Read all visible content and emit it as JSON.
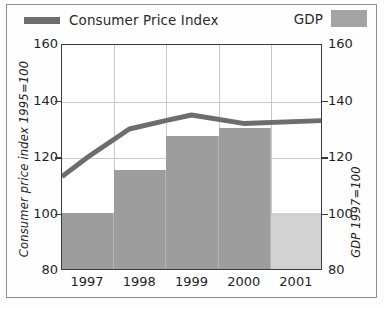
{
  "chart_data": {
    "type": "bar",
    "title": "",
    "subtitle": "",
    "xlabel": "",
    "ylabel": "Consumer price index 1995=100",
    "y2label": "GDP 1997=100",
    "categories": [
      "1997",
      "1998",
      "1999",
      "2000",
      "2001"
    ],
    "ylim": [
      80,
      160
    ],
    "y2lim": [
      80,
      160
    ],
    "yticks": [
      "160",
      "140",
      "120",
      "100",
      "80"
    ],
    "ytick_values": [
      160,
      140,
      120,
      100,
      80
    ],
    "y2ticks": [
      "160",
      "140",
      "120",
      "100",
      "80"
    ],
    "y2tick_values": [
      160,
      140,
      120,
      100,
      80
    ],
    "grid": true,
    "legend_position": "top",
    "series": [
      {
        "name": "Consumer Price Index",
        "type": "line",
        "axis": "left",
        "color": "#6d6d6d",
        "values": [
          120,
          128.5,
          135,
          132,
          133
        ],
        "vertices": [
          {
            "x": 1996.5,
            "y": 113
          },
          {
            "x": 1997.0,
            "y": 120
          },
          {
            "x": 1997.8,
            "y": 130
          },
          {
            "x": 1998.5,
            "y": 133
          },
          {
            "x": 1999.0,
            "y": 135
          },
          {
            "x": 2000.0,
            "y": 132
          },
          {
            "x": 2001.5,
            "y": 133
          }
        ]
      },
      {
        "name": "GDP",
        "type": "bar",
        "axis": "right",
        "color": "#9d9d9d",
        "forecast_color": "#d2d2d2",
        "values": [
          100,
          115,
          127,
          130,
          100
        ],
        "forecast_flags": [
          false,
          false,
          false,
          false,
          true
        ]
      }
    ]
  },
  "legend": {
    "cpi_label": "Consumer Price Index",
    "gdp_label": "GDP"
  },
  "axes": {
    "left_title": "Consumer price index 1995=100",
    "right_title": "GDP 1997=100",
    "left_ticks": [
      "160",
      "140",
      "120",
      "100",
      "80"
    ],
    "right_ticks": [
      "160",
      "140",
      "120",
      "100",
      "80"
    ],
    "x_ticks": [
      "1997",
      "1998",
      "1999",
      "2000",
      "2001"
    ]
  },
  "colors": {
    "line": "#6d6d6d",
    "bar": "#9d9d9d",
    "bar_forecast": "#d2d2d2",
    "axis": "#3a3a3a",
    "grid": "#c9c9c9",
    "frame": "#8f8f8f"
  }
}
